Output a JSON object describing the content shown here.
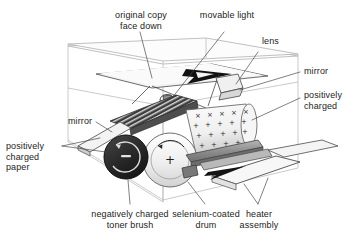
{
  "diagram": {
    "type": "technical-illustration",
    "background_color": "#ffffff",
    "line_color": "#333333",
    "labels": [
      {
        "id": "original-copy-face-down",
        "text": "original copy\nface down"
      },
      {
        "id": "movable-light",
        "text": "movable light"
      },
      {
        "id": "lens",
        "text": "lens"
      },
      {
        "id": "mirror-right",
        "text": "mirror"
      },
      {
        "id": "positively-charged-right",
        "text": "positively\ncharged"
      },
      {
        "id": "mirror-left",
        "text": "mirror"
      },
      {
        "id": "positively-charged-paper",
        "text": "positively\ncharged\npaper"
      },
      {
        "id": "negatively-charged-toner-brush",
        "text": "negatively charged\ntoner brush"
      },
      {
        "id": "selenium-coated-drum",
        "text": "selenium-coated\ndrum"
      },
      {
        "id": "heater-assembly",
        "text": "heater\nassembly"
      }
    ],
    "symbols": {
      "toner_brush_charge": "−",
      "drum_charge": "+",
      "corona_plus": "+",
      "corona_cross": "×"
    },
    "colors": {
      "toner_brush": "#262626",
      "drum": "#eeeeee",
      "drum_edge": "#8a8a8a",
      "charged_cylinder": "#f2f2f2",
      "light_housing": "#4a4a4a",
      "heater_bar": "#8c8c8c",
      "paper": "#f7f7f7",
      "glass": "#fbfbfb",
      "letter_a": "#111111",
      "box_outline": "#b9b9b9"
    }
  }
}
